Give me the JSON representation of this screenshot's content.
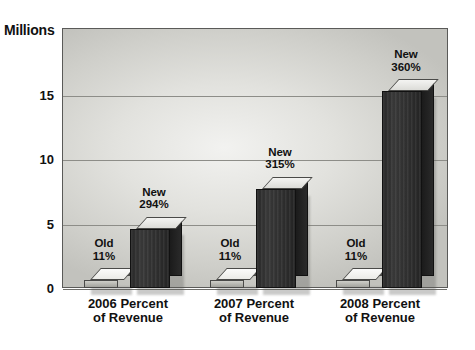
{
  "chart_data": {
    "type": "bar",
    "title": "",
    "subtitle": "",
    "xlabel": "",
    "ylabel": "Millions",
    "ylim": [
      0,
      20
    ],
    "yticks": [
      0,
      5,
      10,
      15
    ],
    "ytick_labels": [
      "0",
      "5",
      "10",
      "15"
    ],
    "grid": true,
    "legend": "none",
    "categories": [
      "2006 Percent of Revenue",
      "2007 Percent of Revenue",
      "2008 Percent of Revenue"
    ],
    "category_lines": [
      {
        "line1": "2006 Percent",
        "line2": "of Revenue"
      },
      {
        "line1": "2007 Percent",
        "line2": "of Revenue"
      },
      {
        "line1": "2008 Percent",
        "line2": "of Revenue"
      }
    ],
    "series": [
      {
        "name": "Old",
        "values": [
          0.6,
          0.6,
          0.6
        ],
        "data_labels": [
          "11%",
          "11%",
          "11%"
        ],
        "label_line1": "Old",
        "color": "#b4b4ae"
      },
      {
        "name": "New",
        "values": [
          4.6,
          7.7,
          15.3
        ],
        "data_labels": [
          "294%",
          "315%",
          "360%"
        ],
        "label_line1": "New",
        "color": "#303030"
      }
    ],
    "annotations": [
      {
        "group": "2006",
        "series": "Old",
        "line1": "Old",
        "line2": "11%"
      },
      {
        "group": "2006",
        "series": "New",
        "line1": "New",
        "line2": "294%"
      },
      {
        "group": "2007",
        "series": "Old",
        "line1": "Old",
        "line2": "11%"
      },
      {
        "group": "2007",
        "series": "New",
        "line1": "New",
        "line2": "315%"
      },
      {
        "group": "2008",
        "series": "Old",
        "line1": "Old",
        "line2": "11%"
      },
      {
        "group": "2008",
        "series": "New",
        "line1": "New",
        "line2": "360%"
      }
    ]
  },
  "axis": {
    "y_title": "Millions"
  },
  "colors": {
    "page_background": "#ffffff",
    "plot_background": "#dededa",
    "plot_border": "#5a5a58",
    "gridline": "#8d8d88",
    "bar_new": "#303030",
    "bar_old": "#b4b4ae",
    "bar_top_light": "#ededea",
    "text": "#111111"
  }
}
